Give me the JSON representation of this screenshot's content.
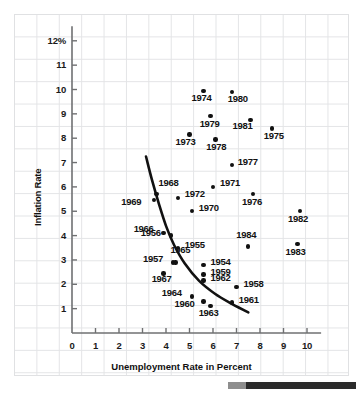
{
  "chart_data": {
    "type": "scatter",
    "title": "",
    "xlabel": "Unemployment Rate in Percent",
    "ylabel": "Inflation Rate",
    "xlim": [
      0,
      10.6
    ],
    "ylim": [
      0,
      12.6
    ],
    "xticks": [
      "0",
      "1",
      "2",
      "3",
      "4",
      "5",
      "6",
      "7",
      "8",
      "9",
      "10"
    ],
    "yticks": [
      "1",
      "2",
      "3",
      "4",
      "5",
      "6",
      "7",
      "8",
      "9",
      "10",
      "11",
      "12%"
    ],
    "grid": true,
    "legend": "none",
    "point_label_key": "year",
    "points": [
      {
        "year": "1954",
        "x": 5.6,
        "y": 2.8
      },
      {
        "year": "1955",
        "x": 4.5,
        "y": 3.5
      },
      {
        "year": "1956",
        "x": 4.2,
        "y": 4.0
      },
      {
        "year": "1957",
        "x": 4.3,
        "y": 2.9
      },
      {
        "year": "1958",
        "x": 7.0,
        "y": 1.9
      },
      {
        "year": "1959",
        "x": 5.6,
        "y": 2.4
      },
      {
        "year": "1960",
        "x": 5.6,
        "y": 1.3
      },
      {
        "year": "1961",
        "x": 6.8,
        "y": 1.25
      },
      {
        "year": "1962",
        "x": 5.6,
        "y": 2.15
      },
      {
        "year": "1963",
        "x": 5.9,
        "y": 1.1
      },
      {
        "year": "1964",
        "x": 5.1,
        "y": 1.5
      },
      {
        "year": "1965",
        "x": 4.4,
        "y": 2.9
      },
      {
        "year": "1966",
        "x": 3.9,
        "y": 4.1
      },
      {
        "year": "1967",
        "x": 3.9,
        "y": 2.45
      },
      {
        "year": "1968",
        "x": 3.6,
        "y": 5.7
      },
      {
        "year": "1969",
        "x": 3.5,
        "y": 5.45
      },
      {
        "year": "1970",
        "x": 5.1,
        "y": 5.0
      },
      {
        "year": "1971",
        "x": 6.0,
        "y": 6.0
      },
      {
        "year": "1972",
        "x": 4.5,
        "y": 5.55
      },
      {
        "year": "1973",
        "x": 5.0,
        "y": 8.15
      },
      {
        "year": "1974",
        "x": 5.6,
        "y": 9.95
      },
      {
        "year": "1975",
        "x": 8.5,
        "y": 8.4
      },
      {
        "year": "1976",
        "x": 7.7,
        "y": 5.7
      },
      {
        "year": "1977",
        "x": 6.8,
        "y": 6.9
      },
      {
        "year": "1978",
        "x": 6.1,
        "y": 7.95
      },
      {
        "year": "1979",
        "x": 5.9,
        "y": 8.9
      },
      {
        "year": "1980",
        "x": 6.8,
        "y": 9.9
      },
      {
        "year": "1981",
        "x": 7.6,
        "y": 8.75
      },
      {
        "year": "1982",
        "x": 9.7,
        "y": 5.0
      },
      {
        "year": "1983",
        "x": 9.6,
        "y": 3.65
      },
      {
        "year": "1984",
        "x": 7.5,
        "y": 3.55
      }
    ],
    "fit_curve": {
      "description": "downward-sloping Phillips curve",
      "points": [
        {
          "x": 3.15,
          "y": 7.25
        },
        {
          "x": 3.4,
          "y": 6.3
        },
        {
          "x": 3.7,
          "y": 5.3
        },
        {
          "x": 4.0,
          "y": 4.4
        },
        {
          "x": 4.35,
          "y": 3.6
        },
        {
          "x": 4.8,
          "y": 2.85
        },
        {
          "x": 5.4,
          "y": 2.15
        },
        {
          "x": 6.1,
          "y": 1.6
        },
        {
          "x": 6.8,
          "y": 1.2
        },
        {
          "x": 7.5,
          "y": 0.85
        }
      ]
    }
  },
  "footer": {
    "bar_visible": true
  }
}
